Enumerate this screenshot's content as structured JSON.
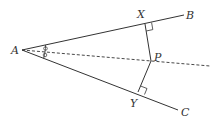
{
  "diagram": {
    "type": "geometry-angle-bisector",
    "points": {
      "A": {
        "label": "A",
        "x": 22,
        "y": 50
      },
      "B": {
        "label": "B",
        "x": 184,
        "y": 15
      },
      "C": {
        "label": "C",
        "x": 178,
        "y": 110
      },
      "X": {
        "label": "X",
        "x": 145,
        "y": 24
      },
      "Y": {
        "label": "Y",
        "x": 138,
        "y": 92
      },
      "P": {
        "label": "P",
        "x": 151,
        "y": 61
      }
    },
    "segments": [
      {
        "from": "A",
        "to": "B",
        "style": "solid"
      },
      {
        "from": "A",
        "to": "C",
        "style": "solid"
      },
      {
        "from": "X",
        "to": "P",
        "style": "solid"
      },
      {
        "from": "P",
        "to": "Y",
        "style": "solid"
      },
      {
        "from": "A",
        "to": "P",
        "style": "dashed",
        "extends_to": {
          "x": 210,
          "y": 66
        }
      }
    ],
    "right_angles": [
      "X",
      "Y"
    ],
    "equal_angle_marks": [
      "BAP",
      "PAC"
    ],
    "colors": {
      "stroke": "#333333",
      "background": "#ffffff"
    }
  }
}
